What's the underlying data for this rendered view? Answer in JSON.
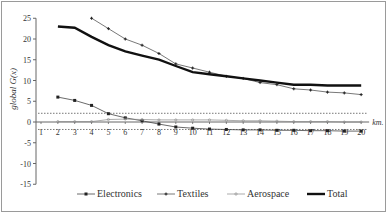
{
  "chart_data": {
    "type": "line",
    "title": "",
    "xlabel": "km",
    "ylabel": "global G(x)",
    "ylim": [
      -15,
      25
    ],
    "yticks": [
      25,
      20,
      15,
      10,
      5,
      0,
      -5,
      -10,
      -15
    ],
    "x": [
      1,
      2,
      3,
      4,
      5,
      6,
      7,
      8,
      9,
      10,
      11,
      12,
      13,
      14,
      15,
      16,
      17,
      18,
      19,
      20
    ],
    "reference_lines": [
      2.1,
      -1.8
    ],
    "grid": false,
    "legend_position": "bottom",
    "series": [
      {
        "name": "Electronics",
        "marker": "square",
        "x": [
          2,
          3,
          4,
          5,
          6,
          7,
          8,
          9,
          10,
          11,
          12,
          13,
          14,
          15,
          16,
          17,
          18,
          19,
          20
        ],
        "values": [
          6.0,
          5.2,
          4.0,
          2.0,
          1.0,
          0.3,
          -0.5,
          -1.2,
          -1.5,
          -1.7,
          -1.8,
          -1.9,
          -1.9,
          -2.0,
          -2.0,
          -2.1,
          -2.1,
          -2.2,
          -2.2
        ]
      },
      {
        "name": "Textiles",
        "marker": "plus",
        "x": [
          4,
          5,
          6,
          7,
          8,
          9,
          10,
          11,
          12,
          13,
          14,
          15,
          16,
          17,
          18,
          19,
          20
        ],
        "values": [
          25.0,
          22.5,
          20.0,
          18.5,
          16.5,
          14.0,
          13.0,
          12.0,
          11.0,
          10.5,
          9.5,
          9.0,
          8.0,
          7.7,
          7.2,
          7.0,
          6.6
        ]
      },
      {
        "name": "Aerospace",
        "marker": "circle",
        "x": [
          2,
          3,
          4,
          5,
          6,
          7,
          8,
          9,
          10,
          11,
          12,
          13,
          14,
          15,
          16,
          17,
          18,
          19,
          20
        ],
        "values": [
          0.1,
          0.1,
          0.1,
          0.6,
          0.7,
          0.6,
          0.5,
          0.5,
          0.5,
          0.5,
          0.4,
          0.3,
          0.3,
          0.2,
          0.1,
          0.1,
          0.1,
          0.0,
          0.0
        ]
      },
      {
        "name": "Total",
        "marker": "none",
        "x": [
          2,
          3,
          4,
          5,
          6,
          7,
          8,
          9,
          10,
          11,
          12,
          13,
          14,
          15,
          16,
          17,
          18,
          19,
          20
        ],
        "values": [
          23.0,
          22.7,
          20.5,
          18.5,
          17.0,
          16.0,
          15.0,
          13.5,
          12.0,
          11.5,
          11.0,
          10.5,
          10.0,
          9.5,
          9.0,
          9.0,
          8.8,
          8.8,
          8.8
        ]
      }
    ]
  },
  "legend": {
    "items": [
      "Electronics",
      "Textiles",
      "Aerospace",
      "Total"
    ]
  },
  "axis": {
    "ylabel": "global G(x)",
    "xlabel": "km"
  }
}
